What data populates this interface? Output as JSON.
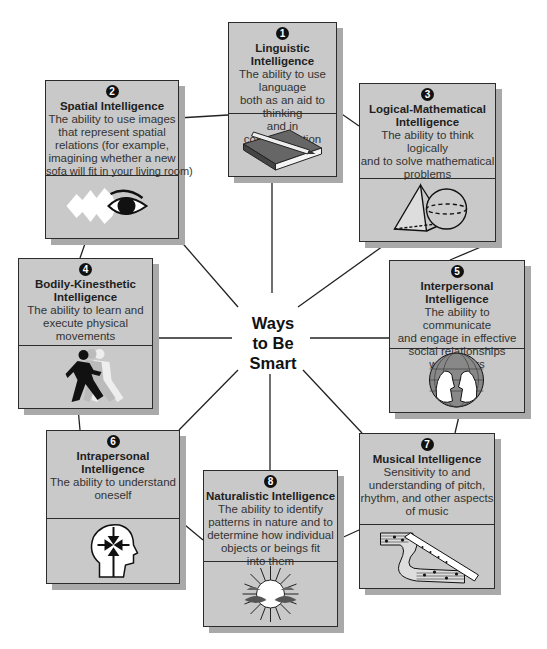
{
  "center": {
    "line1": "Ways",
    "line2": "to Be",
    "line3": "Smart"
  },
  "intelligences": [
    {
      "number": "1",
      "title": "Linguistic Intelligence",
      "description": [
        "The ability to use language",
        "both as an aid to thinking",
        "and in communication"
      ],
      "icon": "book-pencil-icon"
    },
    {
      "number": "2",
      "title": "Spatial Intelligence",
      "description": [
        "The ability to use images",
        "that represent spatial",
        "relations (for example,",
        "imagining whether a new",
        "sofa will fit in your living room)"
      ],
      "icon": "eye-icon"
    },
    {
      "number": "3",
      "title": "Logical-Mathematical Intelligence",
      "title_lines": [
        "Logical-Mathematical",
        "Intelligence"
      ],
      "description": [
        "The ability to think logically",
        "and to solve mathematical",
        "problems"
      ],
      "icon": "pyramid-sphere-icon"
    },
    {
      "number": "4",
      "title": "Bodily-Kinesthetic Intelligence",
      "title_lines": [
        "Bodily-Kinesthetic",
        "Intelligence"
      ],
      "description": [
        "The ability to learn and",
        "execute physical",
        "movements"
      ],
      "icon": "runner-icon"
    },
    {
      "number": "5",
      "title": "Interpersonal Intelligence",
      "title_lines": [
        "Interpersonal",
        "Intelligence"
      ],
      "description": [
        "The ability to communicate",
        "and engage in effective",
        "social relationships",
        "with others"
      ],
      "icon": "globe-faces-icon"
    },
    {
      "number": "6",
      "title": "Intrapersonal Intelligence",
      "title_lines": [
        "Intrapersonal",
        "Intelligence"
      ],
      "description": [
        "The ability to understand",
        "oneself"
      ],
      "icon": "head-arrows-icon"
    },
    {
      "number": "7",
      "title": "Musical Intelligence",
      "description": [
        "Sensitivity to and",
        "understanding of pitch,",
        "rhythm, and other aspects",
        "of music"
      ],
      "icon": "recorder-music-icon"
    },
    {
      "number": "8",
      "title": "Naturalistic Intelligence",
      "description": [
        "The ability to identify",
        "patterns in nature and to",
        "determine how individual",
        "objects or beings fit",
        "into them"
      ],
      "icon": "sun-leaves-icon"
    }
  ],
  "colors": {
    "box_fill": "#c9c9c9",
    "box_border": "#2b2b2b",
    "shadow": "#a9a9a9",
    "text": "#1e1e1e"
  }
}
